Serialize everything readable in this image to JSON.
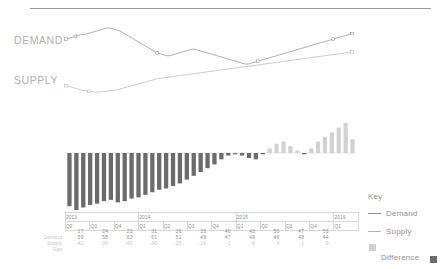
{
  "chart_data": {
    "type": "line",
    "title": "",
    "xlabel": "",
    "ylabel": "",
    "legend_position": "right",
    "grid": false,
    "categories": [
      "2013 Q2",
      "2013 Q3",
      "2013 Q4",
      "2014 Q1",
      "2014 Q2",
      "2014 Q3",
      "2014 Q4",
      "2015 Q1",
      "2015 Q2",
      "2015 Q3",
      "2015 Q4",
      "2016 Q1"
    ],
    "series": [
      {
        "name": "Demand",
        "values": [
          17,
          24,
          23,
          31,
          26,
          33,
          46,
          43,
          50,
          47,
          53,
          null
        ]
      },
      {
        "name": "Supply",
        "values": [
          59,
          58,
          63,
          61,
          51,
          49,
          47,
          49,
          46,
          48,
          44,
          null
        ]
      },
      {
        "name": "Difference",
        "values": [
          -42,
          -34,
          -40,
          -30,
          -25,
          -16,
          -1,
          -6,
          4,
          -1,
          9,
          null
        ]
      }
    ],
    "demand_line_points": [
      72,
      71,
      70,
      69,
      68,
      67,
      67,
      66,
      65,
      64,
      63,
      62,
      61,
      60,
      60,
      61,
      62,
      63,
      65,
      67,
      69,
      71,
      73,
      75,
      77,
      79,
      81,
      83,
      85,
      87,
      88,
      89,
      90,
      90,
      89,
      88,
      87,
      86,
      85,
      84,
      83,
      83,
      84,
      85,
      86,
      87,
      88,
      89,
      90,
      91,
      92,
      93,
      94,
      95,
      96,
      97,
      98,
      99,
      99,
      98,
      97,
      96,
      95,
      94,
      93,
      92,
      91,
      90,
      89,
      88,
      87,
      86,
      85,
      84,
      83,
      82,
      81,
      80,
      79,
      78,
      77,
      76,
      75,
      74,
      73,
      72,
      71,
      70,
      69,
      68,
      67,
      66
    ],
    "supply_line_points": [
      165,
      167,
      169,
      171,
      172,
      173,
      173,
      172,
      171,
      170,
      168,
      166,
      164,
      162,
      160,
      158,
      156,
      155,
      154,
      153,
      152,
      151,
      150,
      149,
      148,
      147,
      146,
      145,
      144,
      143,
      142,
      141,
      140,
      139,
      138,
      137,
      136,
      135,
      134,
      133,
      132,
      131,
      130,
      129,
      128,
      127,
      126,
      125,
      124,
      123,
      122
    ],
    "bar_values_rendered": [
      -42,
      -45,
      -43,
      -41,
      -40,
      -38,
      -37,
      -39,
      -38,
      -36,
      -35,
      -33,
      -31,
      -29,
      -28,
      -26,
      -24,
      -21,
      -18,
      -15,
      -12,
      -9,
      -5,
      -2,
      -1,
      -2,
      -4,
      -5,
      -1,
      2,
      4,
      5,
      3,
      1,
      -1,
      2,
      5,
      7,
      9,
      11,
      13,
      6
    ]
  },
  "line_chart": {
    "demand_label": "DEMAND",
    "supply_label": "SUPPLY"
  },
  "table": {
    "years": [
      {
        "label": "2013",
        "span": 3
      },
      {
        "label": "2014",
        "span": 4
      },
      {
        "label": "2015",
        "span": 4
      },
      {
        "label": "2016",
        "span": 1
      }
    ],
    "quarters": [
      "Q2",
      "Q3",
      "Q4",
      "Q1",
      "Q2",
      "Q3",
      "Q4",
      "Q1",
      "Q2",
      "Q3",
      "Q4",
      "Q1"
    ],
    "row_labels": [
      "Demand",
      "Supply",
      "Gap"
    ],
    "rows": [
      {
        "label": "Demand",
        "values": [
          "17",
          "24",
          "23",
          "31",
          "26",
          "33",
          "46",
          "43",
          "50",
          "47",
          "53",
          ""
        ]
      },
      {
        "label": "Supply",
        "values": [
          "59",
          "58",
          "63",
          "61",
          "51",
          "49",
          "47",
          "49",
          "46",
          "48",
          "44",
          ""
        ]
      },
      {
        "label": "Gap",
        "values": [
          "-42",
          "-34",
          "-40",
          "-30",
          "-25",
          "-16",
          "-1",
          "-6",
          "4",
          "-1",
          "9",
          ""
        ]
      }
    ]
  },
  "key": {
    "title": "Key",
    "demand_label": "Demand",
    "supply_label": "Supply",
    "difference_label": "Difference"
  },
  "colors": {
    "demand_line": "#8c8c8c",
    "supply_line": "#b5b5b5",
    "bar_negative": "#6b6b6b",
    "bar_positive": "#d2d2d2",
    "rule": "#9a9a9a",
    "text_muted": "#8e8e8e"
  }
}
